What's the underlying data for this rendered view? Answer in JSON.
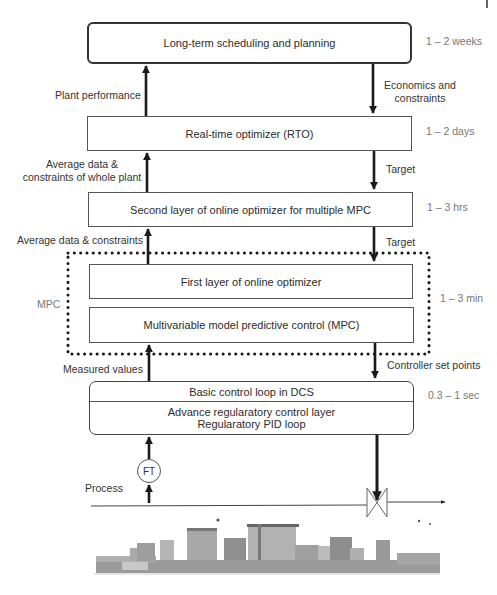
{
  "layers": [
    {
      "label": "Long-term scheduling and planning",
      "time": "1 – 2 weeks"
    },
    {
      "label": "Real-time optimizer (RTO)",
      "time": "1 – 2 days"
    },
    {
      "label": "Second layer of online optimizer for multiple MPC",
      "time": "1 – 3 hrs"
    },
    {
      "label": "First layer of online optimizer",
      "time": "1 – 3 min"
    },
    {
      "label": "Multivariable model predictive control (MPC)"
    },
    {
      "label_top": "Basic control loop in DCS",
      "label_bottom_1": "Advance regularatory control layer",
      "label_bottom_2": "Regularatory PID loop",
      "time": "0.3 – 1 sec"
    }
  ],
  "upward_labels": {
    "plant_performance": "Plant performance",
    "avg_whole_1": "Average data &",
    "avg_whole_2": "constraints of whole plant",
    "avg_constraints": "Average data & constraints",
    "measured": "Measured values"
  },
  "downward_labels": {
    "econ_1": "Economics and",
    "econ_2": "constraints",
    "target_1": "Target",
    "target_2": "Target",
    "setpoints": "Controller set points"
  },
  "mpc_group_label": "MPC",
  "instrument": {
    "ft": "FT"
  },
  "process_label": "Process"
}
